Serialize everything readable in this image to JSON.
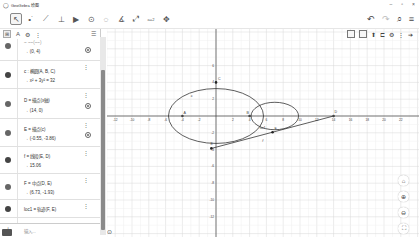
{
  "window": {
    "title": "GeoGebra 绘图",
    "controls": [
      "–",
      "▫",
      "×"
    ]
  },
  "toolbar": {
    "tools": [
      {
        "name": "move-tool",
        "glyph": "↖",
        "selected": true
      },
      {
        "name": "point-tool",
        "glyph": "•˙"
      },
      {
        "name": "segment-tool",
        "glyph": "⟋"
      },
      {
        "name": "perpendicular-tool",
        "glyph": "⊥"
      },
      {
        "name": "polygon-tool",
        "glyph": "▶"
      },
      {
        "name": "circle-tool",
        "glyph": "⊙"
      },
      {
        "name": "circle-three-points-tool",
        "glyph": "◌"
      },
      {
        "name": "angle-tool",
        "glyph": "∡"
      },
      {
        "name": "reflect-tool",
        "glyph": "⤢"
      },
      {
        "name": "slider-tool",
        "glyph": "a=2"
      },
      {
        "name": "move-graphics-tool",
        "glyph": "✥"
      }
    ],
    "right": {
      "undo": "↶",
      "redo": "↷",
      "search": "⌕",
      "menu": "≡"
    }
  },
  "algebra": {
    "header": {
      "algebra_icon": "⊞",
      "tools_icon": "A",
      "settings_icon": "⚙",
      "more_icon": "⋮",
      "sort_icon": "☰"
    },
    "items": [
      {
        "def": "~ ~~(~~)",
        "value": "→ (0, 4)",
        "dot": "grey",
        "visible": true
      },
      {
        "def": "c : 椭圆(A, B, C)",
        "value": "→ x² + 3y² = 32",
        "dot": "dark",
        "visible": false
      },
      {
        "def": "D = 描点(x轴)",
        "value": "→ (14, 0)",
        "dot": "grey",
        "visible": true
      },
      {
        "def": "E = 描点(c)",
        "value": "→ (-0.55, -3.86)",
        "dot": "grey",
        "visible": true
      },
      {
        "def": "f = 线段(E, D)",
        "value": "→ 15.06",
        "dot": "dark",
        "visible": false
      },
      {
        "def": "F = 中点(D, E)",
        "value": "→ (6.73, -1.93)",
        "dot": "grey",
        "visible": false
      },
      {
        "def": "loc1 = 轨迹(F, E)",
        "value": "",
        "dot": "dark",
        "visible": false
      }
    ],
    "input_placeholder": "输入..."
  },
  "graphics": {
    "style_bar": {
      "pin": "⬆",
      "graph": "⊏",
      "gear": "⚙",
      "more": "⋮",
      "next": "➔"
    },
    "zoom_buttons": [
      "⌂",
      "⊕",
      "⊖",
      "⛶"
    ],
    "x_ticks": [
      "-12",
      "-10",
      "-8",
      "-6",
      "-4",
      "-2",
      "2",
      "4",
      "6",
      "8",
      "10",
      "12",
      "14",
      "16",
      "18",
      "20",
      "22"
    ],
    "y_ticks": [
      "6",
      "4",
      "2",
      "-2",
      "-4",
      "-6",
      "-8",
      "-10",
      "-12"
    ],
    "points": {
      "A": [
        -4,
        0
      ],
      "B": [
        4,
        0
      ],
      "C": [
        0,
        4
      ],
      "D": [
        14,
        0
      ],
      "E": [
        -0.55,
        -3.86
      ],
      "F": [
        6.73,
        -1.93
      ]
    },
    "labels": {
      "c": "c",
      "f": "f",
      "loc1": "loc1",
      "A": "A",
      "B": "B",
      "C": "C",
      "D": "D",
      "E": "E",
      "F": "F"
    },
    "colors": {
      "curve": "#333333",
      "grid": "#e0e0e0",
      "axis": "#444444"
    }
  }
}
